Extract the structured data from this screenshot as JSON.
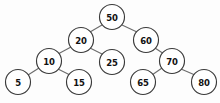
{
  "diagram": {
    "background_color": "#fdfdfd",
    "node_fill": "#ffffff",
    "node_stroke": "#3a3a3a",
    "edge_stroke": "#6b6b6b",
    "label_color": "#111111",
    "node_radius": 12.5
  },
  "nodes": [
    {
      "id": "n50",
      "label": "50",
      "cx": 112,
      "cy": 17,
      "r": 12.5
    },
    {
      "id": "n20",
      "label": "20",
      "cx": 81,
      "cy": 40,
      "r": 12.5
    },
    {
      "id": "n60",
      "label": "60",
      "cx": 146,
      "cy": 40,
      "r": 12.5
    },
    {
      "id": "n10",
      "label": "10",
      "cx": 49,
      "cy": 61,
      "r": 12.5
    },
    {
      "id": "n25",
      "label": "25",
      "cx": 112,
      "cy": 62,
      "r": 12.5
    },
    {
      "id": "n70",
      "label": "70",
      "cx": 172,
      "cy": 61,
      "r": 12.5
    },
    {
      "id": "n5",
      "label": "5",
      "cx": 18,
      "cy": 82,
      "r": 12.5
    },
    {
      "id": "n15",
      "label": "15",
      "cx": 79,
      "cy": 82,
      "r": 12.5
    },
    {
      "id": "n65",
      "label": "65",
      "cx": 143,
      "cy": 82,
      "r": 12.5
    },
    {
      "id": "n80",
      "label": "80",
      "cx": 204,
      "cy": 82,
      "r": 12.5
    }
  ],
  "edges": [
    {
      "id": "e50-20",
      "from": "n50",
      "to": "n20",
      "x1": 102,
      "y1": 25,
      "x2": 90,
      "y2": 32
    },
    {
      "id": "e50-60",
      "from": "n50",
      "to": "n60",
      "x1": 122,
      "y1": 25,
      "x2": 137,
      "y2": 32
    },
    {
      "id": "e20-10",
      "from": "n20",
      "to": "n10",
      "x1": 71,
      "y1": 47,
      "x2": 58,
      "y2": 54
    },
    {
      "id": "e20-25",
      "from": "n20",
      "to": "n25",
      "x1": 90,
      "y1": 48,
      "x2": 104,
      "y2": 55
    },
    {
      "id": "e60-70",
      "from": "n60",
      "to": "n70",
      "x1": 155,
      "y1": 48,
      "x2": 164,
      "y2": 54
    },
    {
      "id": "e10-5",
      "from": "n10",
      "to": "n5",
      "x1": 39,
      "y1": 68,
      "x2": 28,
      "y2": 75
    },
    {
      "id": "e10-15",
      "from": "n10",
      "to": "n15",
      "x1": 58,
      "y1": 69,
      "x2": 70,
      "y2": 75
    },
    {
      "id": "e70-65",
      "from": "n70",
      "to": "n65",
      "x1": 162,
      "y1": 68,
      "x2": 152,
      "y2": 75
    },
    {
      "id": "e70-80",
      "from": "n70",
      "to": "n80",
      "x1": 181,
      "y1": 69,
      "x2": 195,
      "y2": 75
    }
  ]
}
